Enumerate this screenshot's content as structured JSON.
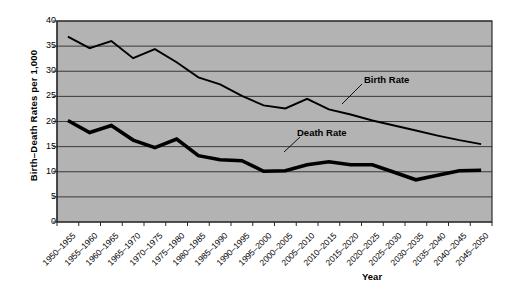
{
  "chart_data": {
    "type": "line",
    "title": "",
    "xlabel": "Year",
    "ylabel": "Birth–Death Rates per 1,000",
    "ylim": [
      0,
      40
    ],
    "ytick_step": 5,
    "yticks": [
      "0",
      "5",
      "10",
      "15",
      "20",
      "25",
      "30",
      "35",
      "40"
    ],
    "grid": "horizontal",
    "legend": "none (inline annotations)",
    "plot_background": "#b3b3b3",
    "line_color": "#000000",
    "categories": [
      "1950–1955",
      "1955–1960",
      "1960–1965",
      "1965–1970",
      "1970–1975",
      "1975–1980",
      "1980–1985",
      "1985–1990",
      "1990–1995",
      "1995–2000",
      "2000–2005",
      "2005–2010",
      "2010–2015",
      "2015–2020",
      "2020–2025",
      "2025–2030",
      "2030–2035",
      "2035–2040",
      "2040–2045",
      "2045–2050"
    ],
    "series": [
      {
        "name": "Birth Rate",
        "values": [
          36.9,
          34.6,
          36.0,
          32.6,
          34.4,
          31.8,
          28.8,
          27.4,
          25.1,
          23.2,
          22.6,
          24.5,
          22.4,
          21.4,
          20.2,
          19.2,
          18.2,
          17.2,
          16.3,
          15.5
        ]
      },
      {
        "name": "Death Rate",
        "values": [
          20.2,
          17.8,
          19.2,
          16.3,
          14.8,
          16.5,
          13.2,
          12.4,
          12.2,
          10.1,
          10.2,
          11.4,
          12.0,
          11.4,
          11.4,
          9.9,
          8.4,
          9.3,
          10.2,
          10.3
        ]
      }
    ],
    "annotations": [
      {
        "text": "Birth Rate",
        "x": 364,
        "y": 74
      },
      {
        "text": "Death Rate",
        "x": 297,
        "y": 127
      }
    ]
  },
  "axis": {
    "ylabel": "Birth–Death Rates per 1,000",
    "xlabel": "Year"
  }
}
